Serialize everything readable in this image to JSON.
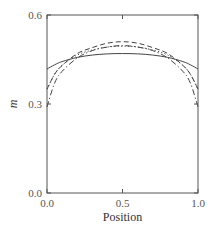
{
  "chart_data": {
    "type": "line",
    "title": "",
    "xlabel": "Position",
    "ylabel": "m",
    "xlim": [
      0.0,
      1.0
    ],
    "ylim": [
      0.0,
      0.6
    ],
    "xticks": [
      "0.0",
      "0.5",
      "1.0"
    ],
    "yticks": [
      "0.0",
      "0.3",
      "0.6"
    ],
    "grid": false,
    "legend": null,
    "x": [
      0.0,
      0.05,
      0.1,
      0.2,
      0.3,
      0.4,
      0.5,
      0.6,
      0.7,
      0.8,
      0.9,
      0.95,
      1.0
    ],
    "series": [
      {
        "name": "solid",
        "style": "solid",
        "values": [
          0.418,
          0.432,
          0.443,
          0.457,
          0.465,
          0.469,
          0.47,
          0.469,
          0.465,
          0.457,
          0.443,
          0.432,
          0.418
        ]
      },
      {
        "name": "dotted",
        "style": "dotted",
        "values": [
          0.35,
          0.4,
          0.43,
          0.465,
          0.482,
          0.492,
          0.495,
          0.492,
          0.482,
          0.465,
          0.43,
          0.4,
          0.35
        ]
      },
      {
        "name": "dashed",
        "style": "dashed",
        "values": [
          0.35,
          0.4,
          0.43,
          0.47,
          0.49,
          0.505,
          0.51,
          0.505,
          0.49,
          0.47,
          0.43,
          0.4,
          0.35
        ]
      },
      {
        "name": "dash-dot",
        "style": "dashdot",
        "values": [
          0.29,
          0.37,
          0.41,
          0.455,
          0.48,
          0.492,
          0.497,
          0.492,
          0.48,
          0.455,
          0.41,
          0.37,
          0.29
        ]
      }
    ]
  }
}
